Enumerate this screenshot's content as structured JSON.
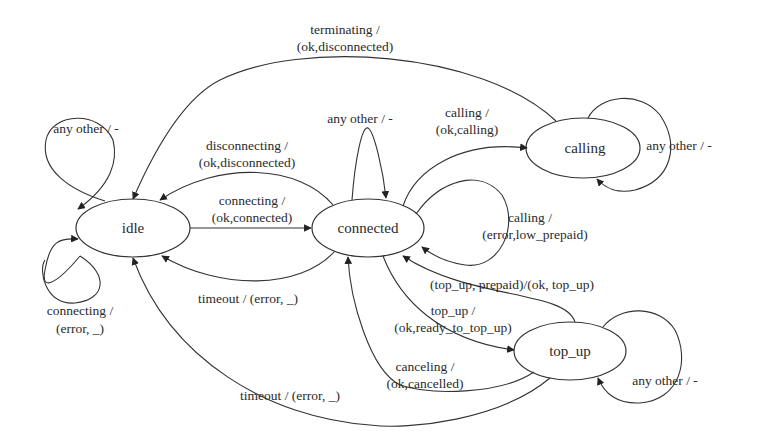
{
  "diagram": {
    "type": "state-machine",
    "colors": {
      "background": "#ffffff",
      "stroke": "#333333",
      "text": "#2a2a2a"
    },
    "states": [
      {
        "id": "idle",
        "label": "idle"
      },
      {
        "id": "connected",
        "label": "connected"
      },
      {
        "id": "calling",
        "label": "calling"
      },
      {
        "id": "top_up",
        "label": "top_up"
      }
    ],
    "transitions": [
      {
        "from": "idle",
        "to": "idle",
        "label": [
          "any other / -"
        ]
      },
      {
        "from": "idle",
        "to": "idle",
        "label": [
          "connecting /",
          "(error, _)"
        ]
      },
      {
        "from": "idle",
        "to": "connected",
        "label": [
          "connecting /",
          "(ok,connected)"
        ]
      },
      {
        "from": "connected",
        "to": "idle",
        "label": [
          "disconnecting /",
          "(ok,disconnected)"
        ]
      },
      {
        "from": "connected",
        "to": "idle",
        "label": [
          "timeout / (error, _)"
        ]
      },
      {
        "from": "connected",
        "to": "connected",
        "label": [
          "any other / -"
        ]
      },
      {
        "from": "connected",
        "to": "calling",
        "label": [
          "calling /",
          "(ok,calling)"
        ]
      },
      {
        "from": "connected",
        "to": "connected",
        "label": [
          "calling /",
          "(error,low_prepaid)"
        ]
      },
      {
        "from": "connected",
        "to": "top_up",
        "label": [
          "top_up /",
          "(ok,ready_to_top_up)"
        ]
      },
      {
        "from": "calling",
        "to": "idle",
        "label": [
          "terminating /",
          "(ok,disconnected)"
        ]
      },
      {
        "from": "calling",
        "to": "calling",
        "label": [
          "any other / -"
        ]
      },
      {
        "from": "top_up",
        "to": "connected",
        "label": [
          "(top_up, prepaid)/(ok, top_up)"
        ]
      },
      {
        "from": "top_up",
        "to": "connected",
        "label": [
          "canceling /",
          "(ok,cancelled)"
        ]
      },
      {
        "from": "top_up",
        "to": "idle",
        "label": [
          "timeout / (error, _)"
        ]
      },
      {
        "from": "top_up",
        "to": "top_up",
        "label": [
          "any other / -"
        ]
      }
    ]
  }
}
